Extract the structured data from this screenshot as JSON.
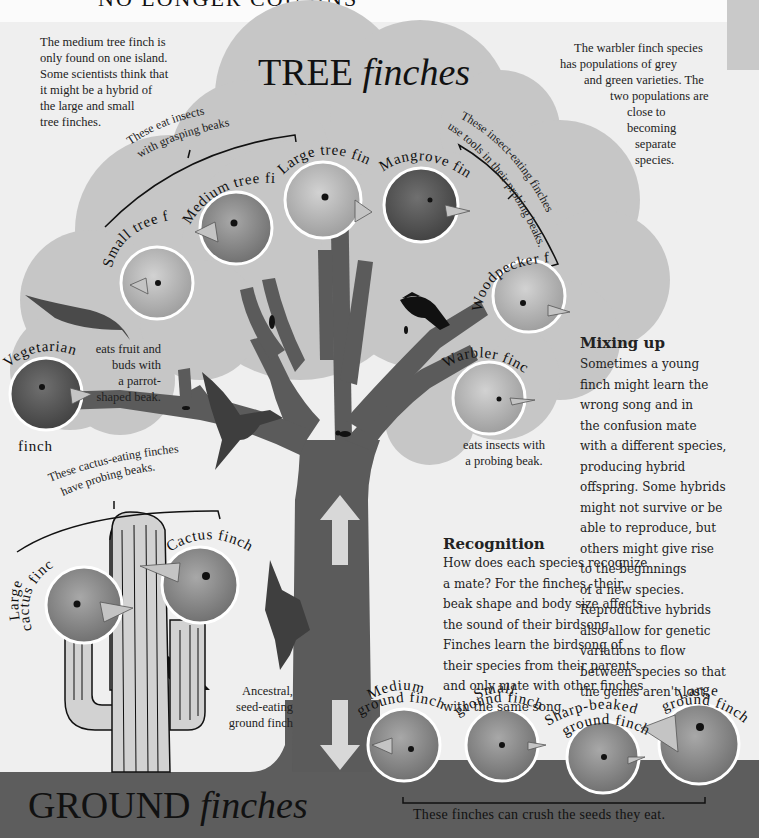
{
  "page": {
    "clipped_header": "NO LONGER COUSINS",
    "colors": {
      "background": "#efefef",
      "cloud": "#c6c6c6",
      "trunk": "#5b5b5b",
      "ground": "#5d5d5d",
      "circle_ring": "#ffffff",
      "arrow": "#d8d8d8"
    }
  },
  "titles": {
    "tree_bold": "TREE",
    "tree_italic": "finches",
    "ground_bold": "GROUND",
    "ground_italic": "finches"
  },
  "notes": {
    "medium_tree_finch": [
      "The medium tree finch is",
      "only found on one island.",
      "Some scientists think that",
      "it might be a hybrid of",
      "the large and small",
      "tree finches."
    ],
    "warbler_varieties": [
      "The warbler finch species",
      "has populations of grey",
      "and green varieties. The",
      "two populations are",
      "close to becoming",
      "separate species."
    ]
  },
  "group_labels": {
    "grasping": [
      "These eat insects",
      "with grasping beaks."
    ],
    "tool_users": [
      "These insect-eating finches",
      "use tools in their probing beaks."
    ],
    "cactus": [
      "These cactus-eating finches",
      "have probing beaks."
    ],
    "seed_crushers": "These finches can crush the seeds they eat."
  },
  "tree_finches": [
    {
      "name": "Small tree finch"
    },
    {
      "name": "Medium tree finch"
    },
    {
      "name": "Large tree finch"
    },
    {
      "name": "Mangrove finch"
    },
    {
      "name": "Woodpecker finch"
    },
    {
      "name": "Warbler finch",
      "desc": [
        "eats insects with",
        "a probing beak."
      ]
    },
    {
      "name_top": "Vegetarian",
      "name_bottom": "finch",
      "desc": [
        "eats fruit and",
        "buds with",
        "a parrot-",
        "shaped beak."
      ]
    }
  ],
  "cactus_finches": [
    {
      "name_line1": "Large",
      "name_line2": "cactus finch"
    },
    {
      "name": "Cactus finch"
    }
  ],
  "ancestral": [
    "Ancestral,",
    "seed-eating",
    "ground finch"
  ],
  "ground_finches": [
    {
      "line1": "Medium",
      "line2": "ground finch"
    },
    {
      "line1": "Small",
      "line2": "ground finch"
    },
    {
      "line1": "Sharp-beaked",
      "line2": "ground finch"
    },
    {
      "line1": "Large",
      "line2": "ground finch"
    }
  ],
  "sections": {
    "recognition": {
      "heading": "Recognition",
      "lines": [
        "How does each species recognize",
        "a mate? For the finches, their",
        "beak shape and body size affects",
        "the sound of their birdsong.",
        "Finches learn the birdsong of",
        "their species from their parents",
        "and only mate with other finches",
        "with the same song."
      ]
    },
    "mixing_up": {
      "heading": "Mixing up",
      "lines": [
        "Sometimes a young",
        "finch might learn the",
        "wrong song and in",
        "the confusion mate",
        "with a different species,",
        "producing hybrid",
        "offspring. Some hybrids",
        "might not survive or be",
        "able to reproduce, but",
        "others might give rise",
        "to the beginnings",
        "of a new species.",
        "Reproductive hybrids",
        "also allow for genetic",
        "variations to flow",
        "between species so that",
        "the genes aren't lost."
      ]
    }
  }
}
